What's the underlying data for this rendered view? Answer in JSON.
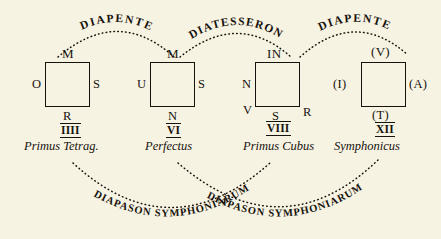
{
  "diagram": {
    "background_color": "#f7f3e3",
    "ink_color": "#16120c",
    "top_arcs": [
      {
        "label": "DIAPENTE",
        "from": "square-1",
        "to": "square-2"
      },
      {
        "label": "DIATESSERON",
        "from": "square-2",
        "to": "square-3"
      },
      {
        "label": "DIAPENTE",
        "from": "square-3",
        "to": "square-4"
      }
    ],
    "bottom_arcs": [
      {
        "label": "DIAPASON SYMPHONIARUM",
        "from": "square-1",
        "to": "square-3"
      },
      {
        "label": "DIAPASON SYMPHONIARUM",
        "from": "square-2",
        "to": "square-4"
      }
    ],
    "squares": [
      {
        "id": "square-1",
        "top": "M",
        "left": "O",
        "right": "S",
        "bottom": "R",
        "bottom_left": "",
        "bottom_right": "",
        "numeral": "IIII",
        "caption": "Primus Tetrag."
      },
      {
        "id": "square-2",
        "top": "M",
        "left": "U",
        "right": "S",
        "bottom": "N",
        "bottom_left": "",
        "bottom_right": "",
        "numeral": "VI",
        "caption": "Perfectus"
      },
      {
        "id": "square-3",
        "top": "IN",
        "left": "N",
        "right": "",
        "bottom": "S",
        "bottom_left": "V",
        "bottom_right": "R",
        "numeral": "VIII",
        "caption": "Primus Cubus"
      },
      {
        "id": "square-4",
        "top": "(V)",
        "left": "(I)",
        "right": "(A)",
        "bottom": "(T)",
        "bottom_left": "",
        "bottom_right": "",
        "numeral": "XII",
        "caption": "Symphonicus"
      }
    ]
  }
}
